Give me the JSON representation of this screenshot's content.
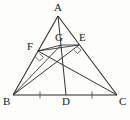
{
  "figure": {
    "type": "geometry-diagram",
    "background_color": "#fdfdfb",
    "stroke_color": "#2a2a2a",
    "label_color": "#1a1a1a"
  },
  "labels": {
    "A": "A",
    "B": "B",
    "C": "C",
    "D": "D",
    "E": "E",
    "F": "F",
    "G": "G"
  },
  "points": {
    "A": {
      "name": "A",
      "x": 58,
      "y": 16
    },
    "B": {
      "name": "B",
      "x": 13,
      "y": 95
    },
    "C": {
      "name": "C",
      "x": 117,
      "y": 95
    },
    "D": {
      "name": "D",
      "x": 66,
      "y": 95
    },
    "E": {
      "name": "E",
      "x": 79,
      "y": 45
    },
    "F": {
      "name": "F",
      "x": 38,
      "y": 51
    },
    "G": {
      "name": "G",
      "x": 61,
      "y": 45
    }
  },
  "label_positions": {
    "A": {
      "x": 54,
      "y": 3
    },
    "B": {
      "x": 4,
      "y": 97
    },
    "C": {
      "x": 119,
      "y": 97
    },
    "D": {
      "x": 62,
      "y": 97
    },
    "E": {
      "x": 79,
      "y": 33
    },
    "F": {
      "x": 28,
      "y": 42
    },
    "G": {
      "x": 56,
      "y": 33
    }
  },
  "segments": [
    {
      "name": "side-AB",
      "from": "A",
      "to": "B",
      "kind": "outline"
    },
    {
      "name": "side-AC",
      "from": "A",
      "to": "C",
      "kind": "outline"
    },
    {
      "name": "side-BC",
      "from": "B",
      "to": "C",
      "kind": "outline"
    },
    {
      "name": "cevian-AD",
      "from": "A",
      "to": "D",
      "kind": "cevian"
    },
    {
      "name": "cevian-BE",
      "from": "B",
      "to": "E",
      "kind": "cevian"
    },
    {
      "name": "cevian-CF",
      "from": "C",
      "to": "F",
      "kind": "cevian"
    },
    {
      "name": "segment-FG",
      "from": "F",
      "to": "G",
      "kind": "inner"
    },
    {
      "name": "segment-GE",
      "from": "G",
      "to": "E",
      "kind": "inner"
    },
    {
      "name": "segment-FE",
      "from": "F",
      "to": "E",
      "kind": "inner"
    }
  ],
  "tick_marks": [
    {
      "name": "tick-BD",
      "x": 40,
      "y": 95,
      "label": "equal-length-mark"
    },
    {
      "name": "tick-DC",
      "x": 92,
      "y": 95,
      "label": "equal-length-mark"
    }
  ],
  "right_angle_marks": [
    {
      "name": "right-angle-at-F",
      "vertex": "F",
      "x": 38,
      "y": 51
    },
    {
      "name": "right-angle-at-E",
      "vertex": "E",
      "x": 79,
      "y": 45
    }
  ],
  "geometry_notes": {
    "median": "AD with BD = DC",
    "altitude_feet": "F on AB, E on AC",
    "intersection_point": "G"
  }
}
